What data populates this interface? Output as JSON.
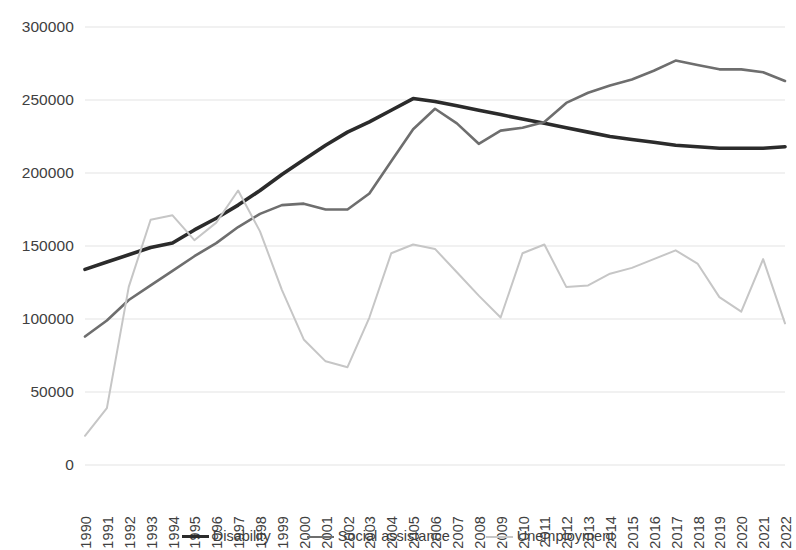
{
  "chart_data": {
    "type": "line",
    "title": "",
    "subtitle": "",
    "xlabel": "",
    "ylabel": "",
    "grid": true,
    "legend_position": "bottom",
    "xlim": [
      1990,
      2022
    ],
    "ylim": [
      0,
      300000
    ],
    "y_ticks": [
      0,
      50000,
      100000,
      150000,
      200000,
      250000,
      300000
    ],
    "y_tick_labels": [
      "0",
      "50000",
      "100000",
      "150000",
      "200000",
      "250000",
      "300000"
    ],
    "x": [
      1990,
      1991,
      1992,
      1993,
      1994,
      1995,
      1996,
      1997,
      1998,
      1999,
      2000,
      2001,
      2002,
      2003,
      2004,
      2005,
      2006,
      2007,
      2008,
      2009,
      2010,
      2011,
      2012,
      2013,
      2014,
      2015,
      2016,
      2017,
      2018,
      2019,
      2020,
      2021,
      2022
    ],
    "categories": [
      "1990",
      "1991",
      "1992",
      "1993",
      "1994",
      "1995",
      "1996",
      "1997",
      "1998",
      "1999",
      "2000",
      "2001",
      "2002",
      "2003",
      "2004",
      "2005",
      "2006",
      "2007",
      "2008",
      "2009",
      "2010",
      "2011",
      "2012",
      "2013",
      "2014",
      "2015",
      "2016",
      "2017",
      "2018",
      "2019",
      "2020",
      "2021",
      "2022"
    ],
    "series": [
      {
        "name": "Disability",
        "color": "#2b2b2b",
        "width": 3.6,
        "values": [
          134000,
          139000,
          144000,
          149000,
          152000,
          161000,
          169000,
          178000,
          188000,
          199000,
          209000,
          219000,
          228000,
          235000,
          243000,
          251000,
          249000,
          246000,
          243000,
          240000,
          237000,
          234000,
          231000,
          228000,
          225000,
          223000,
          221000,
          219000,
          218000,
          217000,
          217000,
          217000,
          218000
        ]
      },
      {
        "name": "Social assistance",
        "color": "#6e6e6e",
        "width": 2.6,
        "values": [
          88000,
          99000,
          113000,
          123000,
          133000,
          143000,
          152000,
          163000,
          172000,
          178000,
          179000,
          175000,
          175000,
          186000,
          208000,
          230000,
          244000,
          234000,
          220000,
          229000,
          231000,
          235000,
          248000,
          255000,
          260000,
          264000,
          270000,
          277000,
          274000,
          271000,
          271000,
          269000,
          263000
        ]
      },
      {
        "name": "Unemployment",
        "color": "#c6c6c6",
        "width": 2.0,
        "values": [
          20000,
          39000,
          122000,
          168000,
          171000,
          154000,
          166000,
          188000,
          160000,
          120000,
          86000,
          71000,
          67000,
          101000,
          145000,
          151000,
          148000,
          132000,
          116000,
          101000,
          145000,
          151000,
          122000,
          123000,
          131000,
          135000,
          141000,
          147000,
          138000,
          115000,
          105000,
          141000,
          97000
        ]
      }
    ]
  },
  "legend": {
    "items": [
      {
        "label": "Disability"
      },
      {
        "label": "Social assistance"
      },
      {
        "label": "Unemployment"
      }
    ]
  }
}
